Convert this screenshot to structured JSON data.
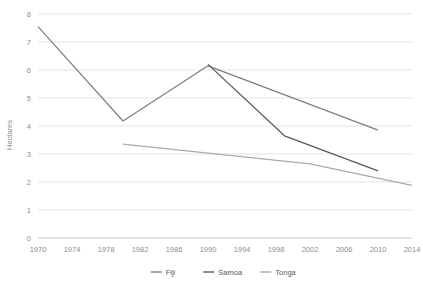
{
  "chart_data": {
    "type": "line",
    "title": "",
    "xlabel": "",
    "ylabel": "Hectares",
    "xlim": [
      1970,
      2014
    ],
    "ylim": [
      0,
      8
    ],
    "grid": true,
    "legend_position": "bottom",
    "x_ticks": [
      "1970",
      "1974",
      "1978",
      "1982",
      "1986",
      "1990",
      "1994",
      "1998",
      "2002",
      "2006",
      "2010",
      "2014"
    ],
    "y_ticks": [
      "0",
      "1",
      "2",
      "3",
      "4",
      "5",
      "6",
      "7",
      "8"
    ],
    "series": [
      {
        "name": "Fiji",
        "color": "#808080",
        "x": [
          1970,
          1980,
          1990,
          2010
        ],
        "values": [
          7.55,
          4.18,
          6.15,
          3.85
        ]
      },
      {
        "name": "Samoa",
        "color": "#595959",
        "x": [
          1990,
          1999,
          2010
        ],
        "values": [
          6.2,
          3.65,
          2.4
        ]
      },
      {
        "name": "Tonga",
        "color": "#aaaaaa",
        "x": [
          1980,
          2002,
          2014
        ],
        "values": [
          3.35,
          2.65,
          1.88
        ]
      }
    ]
  },
  "legend": {
    "items": [
      {
        "label": "Fiji",
        "color": "#808080"
      },
      {
        "label": "Samoa",
        "color": "#595959"
      },
      {
        "label": "Tonga",
        "color": "#aaaaaa"
      }
    ]
  },
  "axes": {
    "y_axis_title": "Hectares"
  }
}
